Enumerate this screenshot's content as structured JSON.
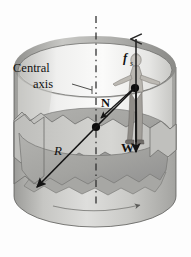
{
  "figure": {
    "name": "rotor-ride-free-body-diagram",
    "background_color": "#fdfdfd",
    "labels": {
      "central_axis_line1": "Central",
      "central_axis_line2": "axis",
      "friction_symbol": "f",
      "friction_subscript": "s",
      "normal_force": "N",
      "weight": "W",
      "radius": "R"
    },
    "colors": {
      "outline": "#3a3a3a",
      "wall_light": "#e8e8e6",
      "wall_mid": "#c2c2bf",
      "wall_dark": "#9a9a97",
      "floor": "#a9a9a6",
      "floor_dark": "#8e8e8b",
      "rim_band": "#b4b4b1",
      "axis_dash": "#2b2b2b",
      "arrow": "#1a1a1a",
      "person": "#b9b6b0",
      "person_shade": "#8d8a85",
      "dot": "#0d0d0d"
    },
    "elements": {
      "cylinder": "rotating-cylinder-ride",
      "cutaway": "wall-cutaway-notch",
      "person": "standing-person-figure",
      "center_dot": "axis-center-point",
      "person_dot": "person-center-of-mass-point",
      "rotation_arrow": "rotation-direction-arrow",
      "leader_line": "central-axis-leader-line"
    },
    "vectors": [
      {
        "id": "friction",
        "symbol": "f_s",
        "direction": "up",
        "from": [
          136,
          140
        ],
        "to": [
          136,
          36
        ]
      },
      {
        "id": "weight",
        "symbol": "W",
        "direction": "down",
        "from": [
          136,
          88
        ],
        "to": [
          136,
          157
        ]
      },
      {
        "id": "normal",
        "symbol": "N",
        "direction": "toward-axis-left-down",
        "from": [
          133,
          89
        ],
        "to": [
          100,
          118
        ]
      },
      {
        "id": "radius",
        "symbol": "R",
        "direction": "down-left",
        "from": [
          96,
          127
        ],
        "to": [
          37,
          187
        ]
      }
    ]
  }
}
